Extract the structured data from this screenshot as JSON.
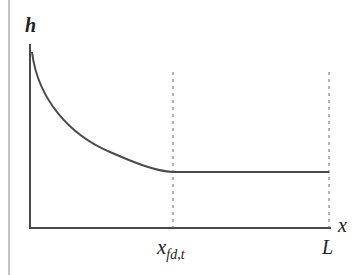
{
  "diagram": {
    "type": "function-sketch",
    "y_axis_label": "h",
    "x_axis_label": "x",
    "x_marks": [
      {
        "id": "xfd",
        "base": "x",
        "subscript": "fd,t"
      },
      {
        "id": "L",
        "base": "L"
      }
    ],
    "curve": "decreasing convex curve from high h near x=0 to a minimum at x_fd,t, then constant (horizontal) until L",
    "colors": {
      "line": "#4a4a4a",
      "dashed": "#666666",
      "text": "#222222"
    }
  }
}
